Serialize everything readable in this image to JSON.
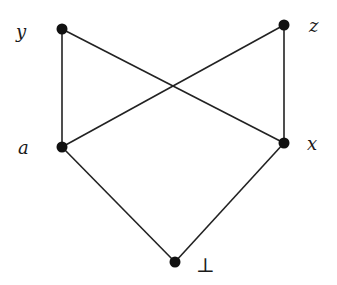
{
  "diagram": {
    "type": "hasse",
    "nodes": [
      {
        "id": "y",
        "label": "y",
        "cx": 62,
        "cy": 29,
        "lx": 16,
        "ly": 38,
        "anchor": "start"
      },
      {
        "id": "z",
        "label": "z",
        "cx": 284,
        "cy": 25,
        "lx": 309,
        "ly": 32,
        "anchor": "start"
      },
      {
        "id": "a",
        "label": "a",
        "cx": 62,
        "cy": 147,
        "lx": 18,
        "ly": 154,
        "anchor": "start"
      },
      {
        "id": "x",
        "label": "x",
        "cx": 284,
        "cy": 143,
        "lx": 307,
        "ly": 150,
        "anchor": "start"
      },
      {
        "id": "bottom",
        "label": "⊥",
        "cx": 175,
        "cy": 262,
        "lx": 196,
        "ly": 272,
        "anchor": "start"
      }
    ],
    "edges": [
      {
        "from": "y",
        "to": "a"
      },
      {
        "from": "y",
        "to": "x"
      },
      {
        "from": "z",
        "to": "a"
      },
      {
        "from": "z",
        "to": "x"
      },
      {
        "from": "a",
        "to": "bottom"
      },
      {
        "from": "x",
        "to": "bottom"
      }
    ],
    "colors": {
      "edge": "#222222",
      "node": "#111111",
      "background": "#ffffff"
    }
  }
}
